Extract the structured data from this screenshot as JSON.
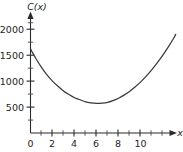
{
  "chart_data": {
    "type": "line",
    "title": "",
    "ylabel": "C(x)",
    "xlabel": "x",
    "xlim": [
      -0.4,
      13.6
    ],
    "ylim": [
      0,
      2320
    ],
    "grid": false,
    "legend": null,
    "x_ticks_major": [
      0,
      2,
      4,
      6,
      8,
      10
    ],
    "x_tick_labels": [
      "0",
      "2",
      "4",
      "6",
      "8",
      "10"
    ],
    "x_ticks_minor": [
      1,
      3,
      5,
      7,
      9,
      11
    ],
    "y_ticks_major": [
      500,
      1000,
      1500,
      2000
    ],
    "y_tick_labels": [
      "500",
      "1000",
      "1500",
      "2000"
    ],
    "y_ticks_minor": [
      250,
      750,
      1250,
      1750,
      2250
    ],
    "series": [
      {
        "name": "C(x)",
        "color": "#3a3a3a",
        "x": [
          0,
          0.5,
          1,
          1.5,
          2,
          2.5,
          3,
          3.5,
          4,
          4.5,
          5,
          5.5,
          6,
          6.5,
          7,
          7.5,
          8,
          8.5,
          9,
          9.5,
          10,
          10.5,
          11,
          11.5,
          12,
          12.5,
          13,
          13.2
        ],
        "values": [
          1620,
          1430,
          1265,
          1120,
          1000,
          900,
          810,
          740,
          680,
          640,
          600,
          580,
          570,
          575,
          590,
          625,
          670,
          730,
          800,
          885,
          980,
          1090,
          1210,
          1345,
          1490,
          1650,
          1820,
          1900
        ]
      }
    ],
    "annotations": {
      "minimum_x": 5.6,
      "minimum_y": 570,
      "y_intercept": 1620
    }
  },
  "axes": {
    "y_axis_label": "C(x)",
    "x_axis_label": "x"
  }
}
